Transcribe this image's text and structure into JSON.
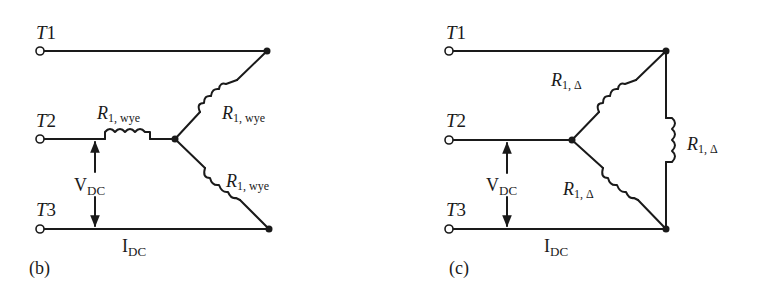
{
  "figure_b": {
    "caption": "(b)",
    "terminals": [
      {
        "letter": "T",
        "num": "1"
      },
      {
        "letter": "T",
        "num": "2"
      },
      {
        "letter": "T",
        "num": "3"
      }
    ],
    "resistors": [
      {
        "symbol": "R",
        "sub": "1, wye"
      },
      {
        "symbol": "R",
        "sub": "1, wye"
      },
      {
        "symbol": "R",
        "sub": "1, wye"
      }
    ],
    "voltage": {
      "main": "V",
      "sub": "DC"
    },
    "current": {
      "main": "I",
      "sub": "DC"
    },
    "connection": "wye"
  },
  "figure_c": {
    "caption": "(c)",
    "terminals": [
      {
        "letter": "T",
        "num": "1"
      },
      {
        "letter": "T",
        "num": "2"
      },
      {
        "letter": "T",
        "num": "3"
      }
    ],
    "resistors": [
      {
        "symbol": "R",
        "sub": "1, Δ"
      },
      {
        "symbol": "R",
        "sub": "1, Δ"
      },
      {
        "symbol": "R",
        "sub": "1, Δ"
      }
    ],
    "voltage": {
      "main": "V",
      "sub": "DC"
    },
    "current": {
      "main": "I",
      "sub": "DC"
    },
    "connection": "delta"
  },
  "colors": {
    "ink": "#1a1a1a",
    "background": "#ffffff"
  }
}
